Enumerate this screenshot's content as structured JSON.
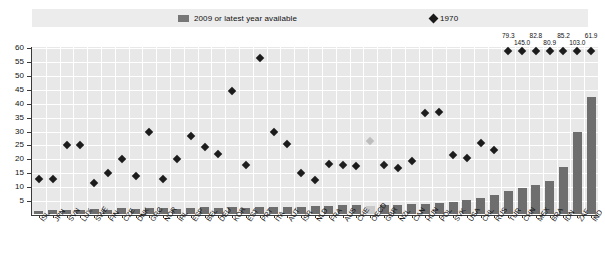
{
  "legend": {
    "bars_label": "2009 or latest year available",
    "bar_swatch_name": "bar-swatch",
    "diamond_label": "1970",
    "diamond_swatch_name": "diamond-swatch"
  },
  "axis": {
    "yticks": [
      "60",
      "55",
      "50",
      "45",
      "40",
      "35",
      "30",
      "25",
      "20",
      "15",
      "10",
      "5"
    ],
    "ymin": 0,
    "ymax": 60
  },
  "chart_data": {
    "type": "bar",
    "title": "",
    "subtitle": "",
    "xlabel": "",
    "ylabel": "",
    "ylim": [
      0,
      60
    ],
    "grid": true,
    "legend_position": "top",
    "categories": [
      "ISL",
      "JPN",
      "SVN",
      "LUX",
      "SWE",
      "FIN",
      "CZE",
      "DNK",
      "GRC",
      "NOR",
      "IRL",
      "ESP",
      "BEL",
      "DEU",
      "KOR",
      "EST",
      "PRT",
      "ITA",
      "AUT",
      "ISR",
      "NLD",
      "FRA",
      "AUS",
      "CHE",
      "OECD",
      "GBR",
      "NZL",
      "CAN",
      "HUN",
      "POL",
      "SVK",
      "USA",
      "CHL",
      "RUS",
      "TUR",
      "CHN",
      "MEX",
      "BRA",
      "IDN",
      "ZAF",
      "IND"
    ],
    "series": [
      {
        "name": "2009 or latest year available",
        "type": "bar",
        "color": "#6e6e6e",
        "values": [
          1.0,
          1.3,
          1.6,
          1.5,
          1.8,
          1.6,
          2.0,
          1.8,
          2.0,
          2.1,
          1.8,
          2.2,
          2.4,
          2.3,
          2.4,
          2.3,
          2.6,
          2.6,
          2.6,
          2.7,
          2.8,
          2.9,
          3.2,
          3.4,
          3.0,
          3.2,
          3.3,
          3.5,
          3.7,
          4.0,
          4.4,
          5.0,
          5.8,
          7.0,
          8.2,
          9.4,
          10.6,
          12.0,
          17.0,
          29.5,
          42.0
        ]
      },
      {
        "name": "1970",
        "type": "scatter",
        "marker": "diamond",
        "color": "#1c1c1c",
        "values": [
          13.0,
          13.0,
          25.0,
          25.0,
          11.5,
          15.0,
          20.0,
          14.0,
          30.0,
          13.0,
          20.0,
          28.5,
          24.5,
          22.0,
          44.5,
          18.0,
          56.5,
          30.0,
          25.5,
          15.0,
          12.5,
          18.5,
          18.0,
          17.5,
          26.5,
          18.0,
          17.0,
          19.5,
          36.5,
          37.0,
          21.5,
          20.5,
          26.0,
          23.5,
          79.3,
          145.0,
          82.8,
          80.9,
          85.2,
          103.0,
          61.9
        ],
        "oecd_index": 24
      }
    ],
    "offscale_labels": [
      {
        "category": "TUR",
        "value": "79.3"
      },
      {
        "category": "CHN",
        "value": "145.0"
      },
      {
        "category": "MEX",
        "value": "82.8"
      },
      {
        "category": "BRA",
        "value": "80.9"
      },
      {
        "category": "IDN",
        "value": "85.2"
      },
      {
        "category": "ZAF",
        "value": "103.0"
      },
      {
        "category": "IND",
        "value": "61.9"
      },
      {
        "category": "EXTRA",
        "value": "126.2"
      }
    ],
    "colors": {
      "bar": "#6e6e6e",
      "bar_highlight": "#c9c9c9",
      "diamond": "#1c1c1c",
      "diamond_highlight": "#bdbdbd",
      "plot_background": "#e8e8e8",
      "gridline": "#ffffff",
      "axis": "#3a3a3a"
    }
  }
}
